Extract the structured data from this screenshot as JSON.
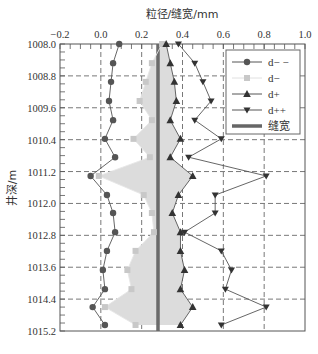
{
  "chart_data": {
    "type": "line",
    "title": "",
    "xlabel": "粒径/缝宽/mm",
    "ylabel": "井深/m",
    "xlim": [
      -0.2,
      1.0
    ],
    "ylim": [
      1008.0,
      1015.2
    ],
    "y_inverted": true,
    "x_axis_position": "top",
    "x_ticks": [
      "-0.2",
      "0.0",
      "0.2",
      "0.4",
      "0.6",
      "0.8",
      "1.0"
    ],
    "y_ticks": [
      "1008.0",
      "1008.8",
      "1009.6",
      "1010.4",
      "1011.2",
      "1012.0",
      "1012.8",
      "1013.6",
      "1014.4",
      "1015.2"
    ],
    "grid": "dashed",
    "legend_position": "upper right",
    "depth": [
      1008.0,
      1008.48,
      1008.95,
      1009.43,
      1009.91,
      1010.38,
      1010.84,
      1011.31,
      1011.79,
      1012.24,
      1012.72,
      1013.19,
      1013.67,
      1014.15,
      1014.6,
      1015.05
    ],
    "series": [
      {
        "name": "d− −",
        "marker": "circle",
        "color": "#555555",
        "values": [
          0.09,
          0.06,
          0.05,
          0.04,
          0.06,
          0.02,
          0.07,
          -0.05,
          0.03,
          0.06,
          0.07,
          0.03,
          0.01,
          0.02,
          -0.04,
          0.02
        ]
      },
      {
        "name": "d−",
        "marker": "square",
        "color": "#c8c8c8",
        "values": [
          0.3,
          0.25,
          0.22,
          0.19,
          0.25,
          0.16,
          0.24,
          -0.01,
          0.21,
          0.25,
          0.26,
          0.17,
          0.13,
          0.15,
          0.02,
          0.17
        ]
      },
      {
        "name": "d+",
        "marker": "triangle-up",
        "color": "#333333",
        "values": [
          0.32,
          0.34,
          0.36,
          0.37,
          0.34,
          0.39,
          0.34,
          0.45,
          0.38,
          0.35,
          0.39,
          0.39,
          0.41,
          0.39,
          0.45,
          0.39
        ]
      },
      {
        "name": "d++",
        "marker": "triangle-down",
        "color": "#333333",
        "values": [
          0.38,
          0.46,
          0.5,
          0.54,
          0.46,
          0.59,
          0.43,
          0.81,
          0.56,
          0.56,
          0.41,
          0.59,
          0.64,
          0.61,
          0.81,
          0.59
        ]
      },
      {
        "name": "缝宽",
        "marker": "none",
        "color": "#666666",
        "constant": 0.28
      }
    ],
    "shaded_band": {
      "between": [
        "d−",
        "d+"
      ],
      "color": "#dcdcdc"
    }
  }
}
